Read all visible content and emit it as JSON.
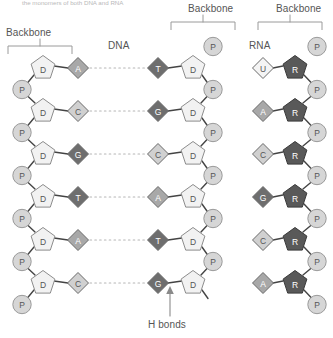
{
  "caption": "the monomers of both DNA and RNA",
  "labels": {
    "dna": "DNA",
    "rna": "RNA",
    "hbonds": "H bonds",
    "backbone_left": "Backbone",
    "backbone_middle": "Backbone",
    "backbone_right": "Backbone"
  },
  "colors": {
    "phosphate_fill": "#d6d6d6",
    "phosphate_stroke": "#9a9a9a",
    "sugar_dna_fill": "#f2f2f2",
    "sugar_dna_stroke": "#8c8c8c",
    "sugar_rna_fill": "#595959",
    "sugar_rna_stroke": "#3a3a3a",
    "base_dark_fill": "#6e6e6e",
    "base_mid_fill": "#a8a8a8",
    "base_light_fill": "#d0d0d0",
    "base_white_fill": "#f4f4f4",
    "bond_line": "#444444",
    "hbond_dash": "#b5b5b5",
    "text_dark": "#555555",
    "text_light": "#ffffff"
  },
  "node_glyphs": {
    "phosphate": "P",
    "deoxyribose": "D",
    "ribose": "R"
  },
  "strands": {
    "dna_left": {
      "name": "DNA left strand",
      "sugar": "D",
      "phosphate": "P",
      "bases": [
        "A",
        "C",
        "G",
        "T",
        "A",
        "C"
      ]
    },
    "dna_right": {
      "name": "DNA right strand",
      "sugar": "D",
      "phosphate": "P",
      "bases": [
        "T",
        "G",
        "C",
        "A",
        "T",
        "G"
      ]
    },
    "rna": {
      "name": "RNA strand",
      "sugar": "R",
      "phosphate": "P",
      "bases": [
        "U",
        "A",
        "C",
        "G",
        "C",
        "A"
      ]
    }
  },
  "base_pairs": [
    {
      "left": "A",
      "right": "T"
    },
    {
      "left": "C",
      "right": "G"
    },
    {
      "left": "G",
      "right": "C"
    },
    {
      "left": "T",
      "right": "A"
    },
    {
      "left": "A",
      "right": "T"
    },
    {
      "left": "C",
      "right": "G"
    }
  ]
}
